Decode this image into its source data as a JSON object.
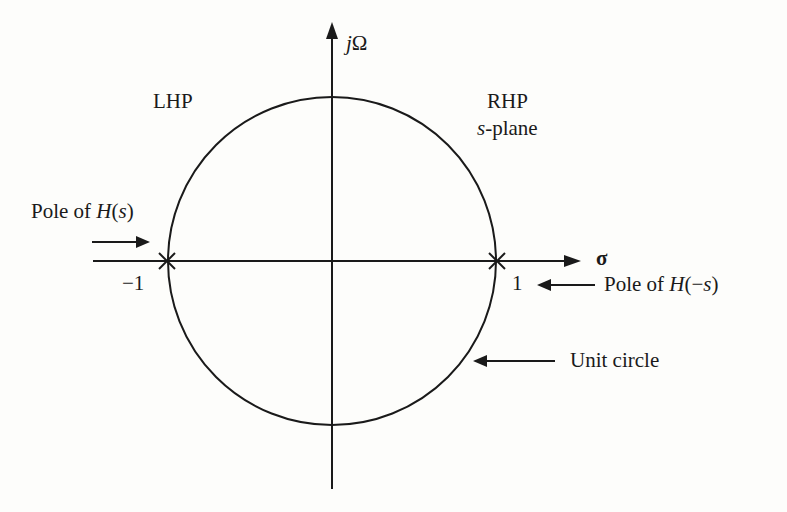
{
  "diagram": {
    "type": "s-plane pole plot",
    "axes": {
      "vertical_label_prefix": "j",
      "vertical_label_symbol": "Ω",
      "horizontal_label": "σ"
    },
    "regions": {
      "left": "LHP",
      "right": "RHP",
      "plane_var": "s",
      "plane_suffix": "-plane"
    },
    "ticks": {
      "left": "−1",
      "right": "1"
    },
    "annotations": {
      "pole_hs": {
        "prefix": "Pole of ",
        "func": "H",
        "open": "(",
        "arg": "s",
        "close": ")"
      },
      "pole_hms": {
        "prefix": "Pole of ",
        "func": "H",
        "open": "(−",
        "arg": "s",
        "close": ")"
      },
      "unit_circle": "Unit circle"
    },
    "poles": [
      {
        "name": "pole of H(s)",
        "sigma": -1,
        "omega": 0
      },
      {
        "name": "pole of H(-s)",
        "sigma": 1,
        "omega": 0
      }
    ],
    "circle": {
      "center": [
        0,
        0
      ],
      "radius": 1
    },
    "stroke_color": "#1a1a1a",
    "background_color": "#fdfdfb"
  }
}
